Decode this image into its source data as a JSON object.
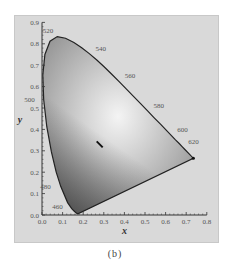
{
  "caption": "(b)",
  "chart_data": {
    "type": "scatter",
    "xlabel": "x",
    "ylabel": "y",
    "xlim": [
      0.0,
      0.8
    ],
    "ylim": [
      0.0,
      0.9
    ],
    "x_ticks": [
      "0.0",
      "0.1",
      "0.2",
      "0.3",
      "0.4",
      "0.5",
      "0.6",
      "0.7",
      "0.8"
    ],
    "y_ticks": [
      "0.0",
      "0.1",
      "0.2",
      "0.3",
      "0.4",
      "0.5",
      "0.6",
      "0.7",
      "0.8",
      "0.9"
    ],
    "grid": false,
    "spectral_locus": [
      {
        "nm": 460,
        "x": 0.144,
        "y": 0.03
      },
      {
        "nm": 480,
        "x": 0.091,
        "y": 0.133
      },
      {
        "nm": 500,
        "x": 0.008,
        "y": 0.538
      },
      {
        "nm": 520,
        "x": 0.074,
        "y": 0.834
      },
      {
        "nm": 540,
        "x": 0.23,
        "y": 0.754
      },
      {
        "nm": 560,
        "x": 0.373,
        "y": 0.624
      },
      {
        "nm": 580,
        "x": 0.512,
        "y": 0.487
      },
      {
        "nm": 600,
        "x": 0.627,
        "y": 0.372
      },
      {
        "nm": 620,
        "x": 0.691,
        "y": 0.308
      }
    ],
    "wavelength_labels": [
      "460",
      "480",
      "500",
      "520",
      "540",
      "560",
      "580",
      "600",
      "620"
    ],
    "marked_point": {
      "x": 0.28,
      "y": 0.33,
      "label": "white-point marker"
    }
  }
}
